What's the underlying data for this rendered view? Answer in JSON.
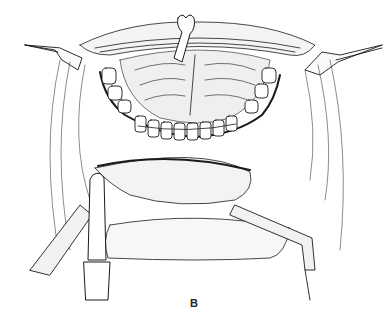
{
  "figure": {
    "panel_label": "B",
    "colors": {
      "ink": "#1a1a1a",
      "background": "#ffffff"
    }
  }
}
